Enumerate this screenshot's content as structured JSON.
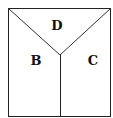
{
  "diagram": {
    "type": "square divided into three regions",
    "regions": [
      {
        "label": "D",
        "position": "top triangle"
      },
      {
        "label": "B",
        "position": "left"
      },
      {
        "label": "C",
        "position": "right"
      }
    ],
    "colors": {
      "line": "#222222",
      "background": "#ffffff",
      "text": "#111111"
    }
  }
}
